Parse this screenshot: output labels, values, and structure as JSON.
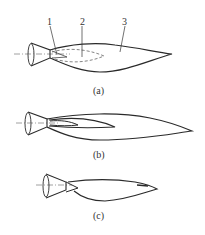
{
  "figure": {
    "panels": [
      {
        "id": "a",
        "caption": "(a)",
        "callouts": [
          {
            "number": "1"
          },
          {
            "number": "2"
          },
          {
            "number": "3"
          }
        ]
      },
      {
        "id": "b",
        "caption": "(b)"
      },
      {
        "id": "c",
        "caption": "(c)"
      }
    ],
    "colors": {
      "stroke": "#2a2a2a",
      "axis": "#888888",
      "dashed": "#666666"
    }
  }
}
